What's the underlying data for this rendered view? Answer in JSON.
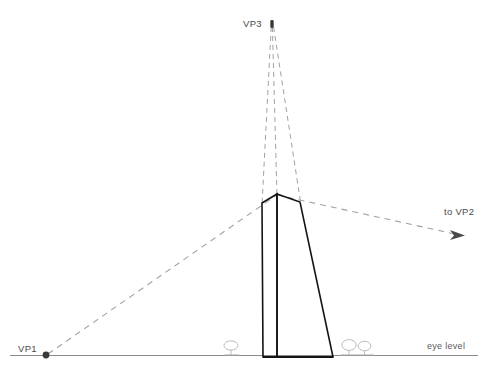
{
  "diagram": {
    "canvas": {
      "width": 485,
      "height": 372,
      "background": "#ffffff"
    },
    "colors": {
      "building_stroke": "#1a1a1a",
      "construction_line": "#9a9a9a",
      "horizon_line": "#8c8c8c",
      "label_text": "#4a4a4a",
      "vanishing_point_dot": "#3a3a3a",
      "foliage_stroke": "#b0b0b0"
    },
    "labels": {
      "vp1": "VP1",
      "vp2": "to VP2",
      "vp3": "VP3",
      "eye_level": "eye level"
    },
    "vanishing_points": [
      {
        "id": "vp1",
        "label": "VP1",
        "x": 46,
        "y": 355,
        "marker": "dot",
        "label_x": 20,
        "label_y": 352
      },
      {
        "id": "vp2",
        "label": "to VP2",
        "x": 458,
        "y": 235,
        "marker": "arrow",
        "label_x": 446,
        "label_y": 214
      },
      {
        "id": "vp3",
        "label": "VP3",
        "x": 272,
        "y": 24,
        "marker": "dot",
        "label_x": 243,
        "label_y": 27
      }
    ],
    "horizon": {
      "label": "eye level",
      "y": 355,
      "x_start": 10,
      "x_end": 478,
      "label_x": 428,
      "label_y": 348
    },
    "building": {
      "name": "tapered-tower",
      "peak": {
        "x": 277,
        "y": 194
      },
      "left_top": {
        "x": 262,
        "y": 203
      },
      "right_top": {
        "x": 300,
        "y": 202
      },
      "left_base": {
        "x": 263,
        "y": 357
      },
      "mid_base": {
        "x": 277,
        "y": 357
      },
      "right_base": {
        "x": 333,
        "y": 357
      }
    },
    "construction_lines": [
      {
        "name": "vp1-to-peak",
        "from": "VP1",
        "to": "roof-peak"
      },
      {
        "name": "peak-to-vp2",
        "from": "roof-peak",
        "to": "VP2"
      },
      {
        "name": "vp3-to-left-edge",
        "from": "VP3",
        "to": "left-vertical-edge"
      },
      {
        "name": "vp3-to-center-edge",
        "from": "VP3",
        "to": "center-vertical-edge"
      },
      {
        "name": "vp3-to-right-edge",
        "from": "VP3",
        "to": "right-vertical-edge"
      }
    ],
    "foliage": [
      {
        "name": "bush-left",
        "x": 232,
        "y": 350
      },
      {
        "name": "bush-right-a",
        "x": 350,
        "y": 350
      },
      {
        "name": "bush-right-b",
        "x": 364,
        "y": 350
      }
    ]
  }
}
